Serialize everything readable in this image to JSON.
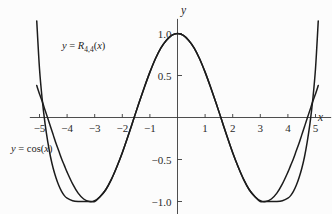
{
  "chart_data": {
    "type": "line",
    "title": "",
    "xlabel": "x",
    "ylabel": "y",
    "xlim": [
      -5.35,
      5.35
    ],
    "ylim": [
      -1.18,
      1.15
    ],
    "grid": false,
    "legend_position": "inline-annotations",
    "xticks": [
      -5,
      -4,
      -3,
      -2,
      -1,
      1,
      2,
      3,
      4,
      5
    ],
    "xticklabels": [
      "−5",
      "−4",
      "−3",
      "−2",
      "−1",
      "1",
      "2",
      "3",
      "4",
      "5"
    ],
    "yticks": [
      -1.0,
      -0.5,
      0.5,
      1.0
    ],
    "yticklabels": [
      "−1.0",
      "−0.5",
      "0.5",
      "1.0"
    ],
    "series": [
      {
        "name": "y = R_{4,4}(x)",
        "label_display": "y = R4,4(x)",
        "x": [
          -5.1,
          -5.0,
          -4.9,
          -4.8,
          -4.7,
          -4.6,
          -4.5,
          -4.4,
          -4.3,
          -4.2,
          -4.1,
          -4.0,
          -3.8,
          -3.6,
          -3.4,
          -3.2,
          -3.0,
          -2.8,
          -2.6,
          -2.4,
          -2.2,
          -2.0,
          -1.8,
          -1.6,
          -1.4,
          -1.2,
          -1.0,
          -0.8,
          -0.6,
          -0.4,
          -0.2,
          0.0,
          0.2,
          0.4,
          0.6,
          0.8,
          1.0,
          1.2,
          1.4,
          1.6,
          1.8,
          2.0,
          2.2,
          2.4,
          2.6,
          2.8,
          3.0,
          3.2,
          3.4,
          3.6,
          3.8,
          4.0,
          4.1,
          4.2,
          4.3,
          4.4,
          4.5,
          4.6,
          4.7,
          4.8,
          4.9,
          5.0,
          5.1
        ],
        "y": [
          1.15,
          0.58,
          0.21,
          -0.07,
          -0.29,
          -0.47,
          -0.61,
          -0.72,
          -0.81,
          -0.88,
          -0.93,
          -0.96,
          -0.99,
          -1.0,
          -1.0,
          -1.0,
          -1.0,
          -0.94,
          -0.86,
          -0.74,
          -0.59,
          -0.42,
          -0.23,
          -0.03,
          0.17,
          0.36,
          0.54,
          0.7,
          0.83,
          0.92,
          0.98,
          1.0,
          0.98,
          0.92,
          0.83,
          0.7,
          0.54,
          0.36,
          0.17,
          -0.03,
          -0.23,
          -0.42,
          -0.59,
          -0.74,
          -0.86,
          -0.94,
          -1.0,
          -1.0,
          -1.0,
          -1.0,
          -0.99,
          -0.96,
          -0.93,
          -0.88,
          -0.81,
          -0.72,
          -0.61,
          -0.47,
          -0.29,
          -0.07,
          0.21,
          0.58,
          1.15
        ]
      },
      {
        "name": "y = cos(x)",
        "label_display": "y = cos(x)",
        "x": [
          -5.1,
          -5.0,
          -4.9,
          -4.8,
          -4.7,
          -4.6,
          -4.5,
          -4.4,
          -4.3,
          -4.2,
          -4.1,
          -4.0,
          -3.8,
          -3.6,
          -3.4,
          -3.2,
          -3.0,
          -2.8,
          -2.6,
          -2.4,
          -2.2,
          -2.0,
          -1.8,
          -1.6,
          -1.4,
          -1.2,
          -1.0,
          -0.8,
          -0.6,
          -0.4,
          -0.2,
          0.0,
          0.2,
          0.4,
          0.6,
          0.8,
          1.0,
          1.2,
          1.4,
          1.6,
          1.8,
          2.0,
          2.2,
          2.4,
          2.6,
          2.8,
          3.0,
          3.2,
          3.4,
          3.6,
          3.8,
          4.0,
          4.1,
          4.2,
          4.3,
          4.4,
          4.5,
          4.6,
          4.7,
          4.8,
          4.9,
          5.0,
          5.1
        ],
        "y": [
          0.38,
          0.28,
          0.19,
          0.09,
          -0.01,
          -0.11,
          -0.21,
          -0.31,
          -0.4,
          -0.49,
          -0.57,
          -0.65,
          -0.79,
          -0.9,
          -0.97,
          -1.0,
          -0.99,
          -0.94,
          -0.86,
          -0.74,
          -0.59,
          -0.42,
          -0.23,
          -0.03,
          0.17,
          0.36,
          0.54,
          0.7,
          0.83,
          0.92,
          0.98,
          1.0,
          0.98,
          0.92,
          0.83,
          0.7,
          0.54,
          0.36,
          0.17,
          -0.03,
          -0.23,
          -0.42,
          -0.59,
          -0.74,
          -0.86,
          -0.94,
          -0.99,
          -1.0,
          -0.97,
          -0.9,
          -0.79,
          -0.65,
          -0.57,
          -0.49,
          -0.4,
          -0.31,
          -0.21,
          -0.11,
          -0.01,
          0.09,
          0.19,
          0.28,
          0.38
        ]
      }
    ],
    "annotations": [
      {
        "name": "rational-approximation-label",
        "text": "y = R4,4(x)",
        "x": -4.2,
        "y": 0.82
      },
      {
        "name": "cosine-label",
        "text": "y = cos(x)",
        "x": -4.9,
        "y": -0.43
      }
    ],
    "colors": {
      "curve": "#1c1c1c",
      "axis": "#3a3a3a",
      "background": "#fcfcfc",
      "text": "#2a2a2a"
    }
  }
}
